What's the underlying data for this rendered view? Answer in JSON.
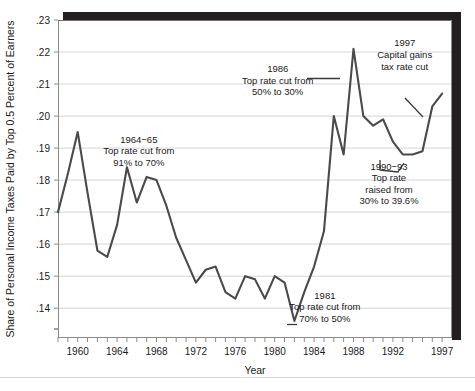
{
  "chart_data": {
    "type": "line",
    "title": "",
    "xlabel": "Year",
    "ylabel": "Share of Personal Income Taxes Paid by Top 0.5 Percent of Earners",
    "xlim": [
      1958,
      1998
    ],
    "ylim": [
      0.131,
      0.23
    ],
    "grid": "horizontal",
    "legend": "none",
    "x_tick_labels": [
      "1960",
      "1964",
      "1968",
      "1972",
      "1976",
      "1980",
      "1984",
      "1988",
      "1992",
      "1997"
    ],
    "x_tick_values": [
      1960,
      1964,
      1968,
      1972,
      1976,
      1980,
      1984,
      1988,
      1992,
      1997
    ],
    "x_minor_ticks_every": 1,
    "y_tick_labels": [
      ".14",
      ".15",
      ".16",
      ".17",
      ".18",
      ".19",
      ".20",
      ".21",
      ".22",
      ".23"
    ],
    "y_tick_values": [
      0.14,
      0.15,
      0.16,
      0.17,
      0.18,
      0.19,
      0.2,
      0.21,
      0.22,
      0.23
    ],
    "series": [
      {
        "name": "Share of personal income taxes paid by top 0.5 percent of earners",
        "color": "#4a4a4a",
        "x": [
          1958,
          1959,
          1960,
          1961,
          1962,
          1963,
          1964,
          1965,
          1966,
          1967,
          1968,
          1969,
          1970,
          1971,
          1972,
          1973,
          1974,
          1975,
          1976,
          1977,
          1978,
          1979,
          1980,
          1981,
          1982,
          1983,
          1984,
          1985,
          1986,
          1987,
          1988,
          1989,
          1990,
          1991,
          1992,
          1993,
          1994,
          1995,
          1996,
          1997
        ],
        "y": [
          0.17,
          0.182,
          0.195,
          0.176,
          0.158,
          0.156,
          0.166,
          0.184,
          0.173,
          0.181,
          0.18,
          0.172,
          0.162,
          0.155,
          0.148,
          0.152,
          0.153,
          0.145,
          0.143,
          0.15,
          0.149,
          0.143,
          0.15,
          0.148,
          0.136,
          0.145,
          0.153,
          0.164,
          0.2,
          0.188,
          0.221,
          0.2,
          0.197,
          0.199,
          0.192,
          0.188,
          0.188,
          0.189,
          0.203,
          0.207
        ]
      }
    ],
    "annotations": [
      {
        "id": "annot-1964",
        "lines": [
          "1964−65",
          "Top rate cut from",
          "91% to 70%"
        ],
        "x": 1966.2,
        "y_top": 0.1917,
        "align": "middle",
        "leader": "none"
      },
      {
        "id": "annot-1986",
        "lines": [
          "1986",
          "Top rate cut from",
          "50% to 30%"
        ],
        "x": 1980.3,
        "y_top": 0.2138,
        "align": "middle",
        "leader": "horizontal"
      },
      {
        "id": "annot-1997",
        "lines": [
          "1997",
          "Capital gains",
          "tax rate cut"
        ],
        "x": 1993.2,
        "y_top": 0.2218,
        "align": "middle",
        "leader": "diagonal"
      },
      {
        "id": "annot-1990-93",
        "lines": [
          "1990−93",
          "Top rate",
          "raised from",
          "30% to 39.6%"
        ],
        "x": 1991.6,
        "y_top": 0.1833,
        "align": "middle",
        "leader": "none"
      },
      {
        "id": "annot-1981",
        "lines": [
          "1981",
          "Top rate cut from",
          "70% to 50%"
        ],
        "x": 1985.1,
        "y_top": 0.143,
        "align": "middle",
        "leader": "dash"
      }
    ]
  },
  "colors": {
    "line": "#4a4a4a",
    "grid": "#d6d6d6",
    "axis": "#8a8a8a",
    "text": "#1a1a1a",
    "shadow": "#231f20",
    "plot_background": "#ffffff"
  }
}
